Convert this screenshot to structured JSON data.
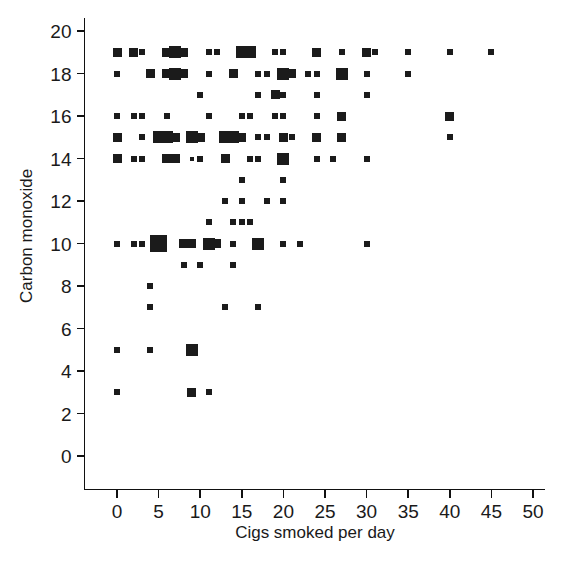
{
  "chart_data": {
    "type": "scatter",
    "title": "",
    "xlabel": "Cigs smoked per day",
    "ylabel": "Carbon monoxide",
    "xlim": [
      -2.2,
      51.5
    ],
    "ylim": [
      -1.2,
      20.6
    ],
    "xticks": [
      0,
      5,
      10,
      15,
      20,
      25,
      30,
      35,
      40,
      45,
      50
    ],
    "yticks": [
      0,
      2,
      4,
      6,
      8,
      10,
      12,
      14,
      16,
      18,
      20
    ],
    "xtick_labels": [
      "0",
      "5",
      "10",
      "15",
      "20",
      "25",
      "30",
      "35",
      "40",
      "45",
      "50"
    ],
    "ytick_labels": [
      "0",
      "2",
      "4",
      "6",
      "8",
      "10",
      "12",
      "14",
      "16",
      "18",
      "20"
    ],
    "grid": false,
    "legend": "none",
    "marker_shape": "square",
    "marker_color": "#1b1b1b",
    "note": "Marker size encodes number of overlapping observations at that (x, y) pair.",
    "points": [
      {
        "x": 0,
        "y": 19,
        "size": 3
      },
      {
        "x": 2,
        "y": 19,
        "size": 3
      },
      {
        "x": 3,
        "y": 19,
        "size": 2
      },
      {
        "x": 6,
        "y": 19,
        "size": 3
      },
      {
        "x": 7,
        "y": 19,
        "size": 4
      },
      {
        "x": 8,
        "y": 19,
        "size": 3
      },
      {
        "x": 11,
        "y": 19,
        "size": 2
      },
      {
        "x": 12,
        "y": 19,
        "size": 2
      },
      {
        "x": 15,
        "y": 19,
        "size": 4
      },
      {
        "x": 16,
        "y": 19,
        "size": 4
      },
      {
        "x": 19,
        "y": 19,
        "size": 2
      },
      {
        "x": 20,
        "y": 19,
        "size": 2
      },
      {
        "x": 24,
        "y": 19,
        "size": 3
      },
      {
        "x": 27,
        "y": 19,
        "size": 2
      },
      {
        "x": 30,
        "y": 19,
        "size": 3
      },
      {
        "x": 31,
        "y": 19,
        "size": 2
      },
      {
        "x": 35,
        "y": 19,
        "size": 2
      },
      {
        "x": 40,
        "y": 19,
        "size": 2
      },
      {
        "x": 45,
        "y": 19,
        "size": 2
      },
      {
        "x": 0,
        "y": 18,
        "size": 2
      },
      {
        "x": 4,
        "y": 18,
        "size": 3
      },
      {
        "x": 6,
        "y": 18,
        "size": 3
      },
      {
        "x": 7,
        "y": 18,
        "size": 4
      },
      {
        "x": 8,
        "y": 18,
        "size": 3
      },
      {
        "x": 11,
        "y": 18,
        "size": 2
      },
      {
        "x": 14,
        "y": 18,
        "size": 3
      },
      {
        "x": 17,
        "y": 18,
        "size": 2
      },
      {
        "x": 18,
        "y": 18,
        "size": 2
      },
      {
        "x": 20,
        "y": 18,
        "size": 4
      },
      {
        "x": 21,
        "y": 18,
        "size": 3
      },
      {
        "x": 23,
        "y": 18,
        "size": 2
      },
      {
        "x": 24,
        "y": 18,
        "size": 2
      },
      {
        "x": 27,
        "y": 18,
        "size": 4
      },
      {
        "x": 30,
        "y": 18,
        "size": 2
      },
      {
        "x": 35,
        "y": 18,
        "size": 2
      },
      {
        "x": 10,
        "y": 17,
        "size": 2
      },
      {
        "x": 17,
        "y": 17,
        "size": 2
      },
      {
        "x": 19,
        "y": 17,
        "size": 3
      },
      {
        "x": 20,
        "y": 17,
        "size": 2
      },
      {
        "x": 24,
        "y": 17,
        "size": 2
      },
      {
        "x": 30,
        "y": 17,
        "size": 2
      },
      {
        "x": 0,
        "y": 16,
        "size": 2
      },
      {
        "x": 2,
        "y": 16,
        "size": 2
      },
      {
        "x": 3,
        "y": 16,
        "size": 2
      },
      {
        "x": 6,
        "y": 16,
        "size": 2
      },
      {
        "x": 11,
        "y": 16,
        "size": 2
      },
      {
        "x": 15,
        "y": 16,
        "size": 2
      },
      {
        "x": 16,
        "y": 16,
        "size": 2
      },
      {
        "x": 19,
        "y": 16,
        "size": 2
      },
      {
        "x": 20,
        "y": 16,
        "size": 2
      },
      {
        "x": 24,
        "y": 16,
        "size": 2
      },
      {
        "x": 27,
        "y": 16,
        "size": 3
      },
      {
        "x": 40,
        "y": 16,
        "size": 3
      },
      {
        "x": 0,
        "y": 15,
        "size": 3
      },
      {
        "x": 3,
        "y": 15,
        "size": 2
      },
      {
        "x": 5,
        "y": 15,
        "size": 4
      },
      {
        "x": 6,
        "y": 15,
        "size": 4
      },
      {
        "x": 7,
        "y": 15,
        "size": 3
      },
      {
        "x": 9,
        "y": 15,
        "size": 4
      },
      {
        "x": 10,
        "y": 15,
        "size": 3
      },
      {
        "x": 13,
        "y": 15,
        "size": 4
      },
      {
        "x": 14,
        "y": 15,
        "size": 4
      },
      {
        "x": 15,
        "y": 15,
        "size": 3
      },
      {
        "x": 17,
        "y": 15,
        "size": 2
      },
      {
        "x": 18,
        "y": 15,
        "size": 2
      },
      {
        "x": 20,
        "y": 15,
        "size": 3
      },
      {
        "x": 21,
        "y": 15,
        "size": 2
      },
      {
        "x": 24,
        "y": 15,
        "size": 3
      },
      {
        "x": 27,
        "y": 15,
        "size": 3
      },
      {
        "x": 40,
        "y": 15,
        "size": 2
      },
      {
        "x": 0,
        "y": 14,
        "size": 3
      },
      {
        "x": 2,
        "y": 14,
        "size": 2
      },
      {
        "x": 3,
        "y": 14,
        "size": 2
      },
      {
        "x": 6,
        "y": 14,
        "size": 3
      },
      {
        "x": 7,
        "y": 14,
        "size": 3
      },
      {
        "x": 9,
        "y": 14,
        "size": 1
      },
      {
        "x": 10,
        "y": 14,
        "size": 2
      },
      {
        "x": 13,
        "y": 14,
        "size": 3
      },
      {
        "x": 16,
        "y": 14,
        "size": 2
      },
      {
        "x": 17,
        "y": 14,
        "size": 2
      },
      {
        "x": 20,
        "y": 14,
        "size": 4
      },
      {
        "x": 24,
        "y": 14,
        "size": 2
      },
      {
        "x": 26,
        "y": 14,
        "size": 2
      },
      {
        "x": 30,
        "y": 14,
        "size": 2
      },
      {
        "x": 15,
        "y": 13,
        "size": 2
      },
      {
        "x": 20,
        "y": 13,
        "size": 2
      },
      {
        "x": 13,
        "y": 12,
        "size": 2
      },
      {
        "x": 15,
        "y": 12,
        "size": 2
      },
      {
        "x": 18,
        "y": 12,
        "size": 2
      },
      {
        "x": 20,
        "y": 12,
        "size": 2
      },
      {
        "x": 11,
        "y": 11,
        "size": 2
      },
      {
        "x": 14,
        "y": 11,
        "size": 2
      },
      {
        "x": 15,
        "y": 11,
        "size": 2
      },
      {
        "x": 16,
        "y": 11,
        "size": 2
      },
      {
        "x": 0,
        "y": 10,
        "size": 2
      },
      {
        "x": 2,
        "y": 10,
        "size": 2
      },
      {
        "x": 3,
        "y": 10,
        "size": 2
      },
      {
        "x": 5,
        "y": 10,
        "size": 5
      },
      {
        "x": 8,
        "y": 10,
        "size": 3
      },
      {
        "x": 9,
        "y": 10,
        "size": 3
      },
      {
        "x": 11,
        "y": 10,
        "size": 4
      },
      {
        "x": 12,
        "y": 10,
        "size": 3
      },
      {
        "x": 14,
        "y": 10,
        "size": 2
      },
      {
        "x": 17,
        "y": 10,
        "size": 4
      },
      {
        "x": 20,
        "y": 10,
        "size": 2
      },
      {
        "x": 22,
        "y": 10,
        "size": 2
      },
      {
        "x": 30,
        "y": 10,
        "size": 2
      },
      {
        "x": 8,
        "y": 9,
        "size": 2
      },
      {
        "x": 10,
        "y": 9,
        "size": 2
      },
      {
        "x": 14,
        "y": 9,
        "size": 2
      },
      {
        "x": 4,
        "y": 8,
        "size": 2
      },
      {
        "x": 4,
        "y": 7,
        "size": 2
      },
      {
        "x": 13,
        "y": 7,
        "size": 2
      },
      {
        "x": 17,
        "y": 7,
        "size": 2
      },
      {
        "x": 0,
        "y": 5,
        "size": 2
      },
      {
        "x": 4,
        "y": 5,
        "size": 2
      },
      {
        "x": 9,
        "y": 5,
        "size": 4
      },
      {
        "x": 0,
        "y": 3,
        "size": 2
      },
      {
        "x": 9,
        "y": 3,
        "size": 3
      },
      {
        "x": 11,
        "y": 3,
        "size": 2
      }
    ]
  }
}
